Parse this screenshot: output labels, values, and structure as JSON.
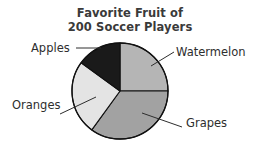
{
  "chart_data": {
    "type": "pie",
    "title": "Favorite Fruit of 200 Soccer Players",
    "title_lines": [
      "Favorite Fruit of",
      "200 Soccer Players"
    ],
    "total": 200,
    "total_unit": "Soccer Players",
    "categories": [
      "Watermelon",
      "Grapes",
      "Oranges",
      "Apples"
    ],
    "values": [
      50,
      70,
      50,
      30
    ],
    "percentages": [
      25,
      35,
      25,
      15
    ],
    "colors": [
      "#b5b5b5",
      "#a2a2a2",
      "#e4e4e4",
      "#1a1a1a"
    ],
    "slices": [
      {
        "label": "Watermelon",
        "value": 50,
        "percent": 25,
        "color": "#b5b5b5",
        "start_angle": 0,
        "end_angle": 90
      },
      {
        "label": "Grapes",
        "value": 70,
        "percent": 35,
        "color": "#a2a2a2",
        "start_angle": 90,
        "end_angle": 216
      },
      {
        "label": "Oranges",
        "value": 50,
        "percent": 25,
        "color": "#e4e4e4",
        "start_angle": 216,
        "end_angle": 306
      },
      {
        "label": "Apples",
        "value": 30,
        "percent": 15,
        "color": "#1a1a1a",
        "start_angle": 306,
        "end_angle": 360
      }
    ],
    "xlabel": "",
    "ylabel": "",
    "legend": "none",
    "grid": false,
    "labels_position": "outside-with-leader-lines",
    "geometry": {
      "center_x": 120,
      "center_y": 91,
      "radius": 48,
      "outline_color": "#111111",
      "outline_width": 1.3,
      "start_at_twelve_oclock": true
    }
  },
  "labels": {
    "apples": "Apples",
    "watermelon": "Watermelon",
    "oranges": "Oranges",
    "grapes": "Grapes"
  },
  "title": {
    "line1": "Favorite Fruit of",
    "line2": "200 Soccer Players"
  }
}
